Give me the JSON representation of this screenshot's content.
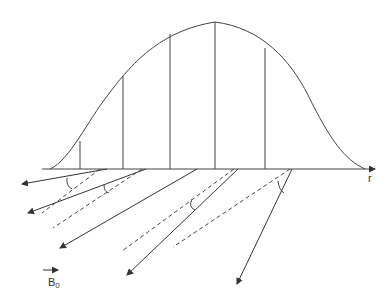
{
  "diagram": {
    "axis_label": "r",
    "field_label_main": "B",
    "field_label_sub": "0",
    "stroke_color": "#444444",
    "curve": {
      "type": "gaussian",
      "peak_x": 215,
      "peak_y": 22,
      "baseline_y": 169
    },
    "vertical_lines_x": [
      80,
      123,
      170,
      215,
      265
    ],
    "solid_arrows": [
      {
        "from": [
          107,
          169
        ],
        "to": [
          22,
          184
        ]
      },
      {
        "from": [
          146,
          169
        ],
        "to": [
          28,
          213
        ]
      },
      {
        "from": [
          197,
          169
        ],
        "to": [
          60,
          248
        ]
      },
      {
        "from": [
          238,
          169
        ],
        "to": [
          127,
          275
        ]
      },
      {
        "from": [
          292,
          169
        ],
        "to": [
          237,
          284
        ]
      }
    ],
    "dashed_lines": [
      {
        "from": [
          100,
          169
        ],
        "to": [
          42,
          213
        ]
      },
      {
        "from": [
          142,
          169
        ],
        "to": [
          53,
          228
        ]
      },
      {
        "from": [
          234,
          169
        ],
        "to": [
          122,
          251
        ]
      },
      {
        "from": [
          290,
          169
        ],
        "to": [
          173,
          247
        ]
      }
    ],
    "angle_arcs": 4
  }
}
